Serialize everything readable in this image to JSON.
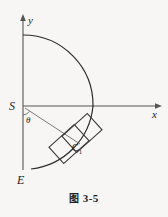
{
  "figure": {
    "caption_prefix": "图",
    "caption_number": "3-5",
    "caption_full": "图 3-5",
    "background_color": "#f7f6f4",
    "ink_color": "#2b2b2b",
    "width": 168,
    "height": 217
  },
  "axes": {
    "x_label": "x",
    "y_label": "y",
    "origin_label": "S",
    "x_axis_y": 106,
    "y_axis_x": 23,
    "x_axis_start": 23,
    "x_axis_end": 160,
    "y_axis_top": 16,
    "y_axis_bottom": 106
  },
  "labels": {
    "origin": "S",
    "lower_end": "E",
    "angle": "θ",
    "body_center": "C",
    "body_center_subscript": "1",
    "body_center_full": "C₁"
  },
  "arc": {
    "description": "semicircular arc from upper point on y-axis through x-axis crossing down to lower point near E",
    "top_point": [
      23,
      35
    ],
    "right_crossing": [
      93,
      106
    ],
    "bottom_point": [
      30,
      168
    ],
    "radius_px": 70
  },
  "vertical_segment": {
    "from": [
      23,
      106
    ],
    "to": [
      23,
      168
    ],
    "end_label": "E"
  },
  "ray": {
    "from": [
      26,
      109
    ],
    "to": [
      78,
      143
    ],
    "angle_label": "θ",
    "angle_label_pos": [
      27,
      120
    ]
  },
  "bodies": [
    {
      "name": "rectangle-upper",
      "center": [
        80,
        134
      ],
      "width": 34,
      "height": 22,
      "rotation_deg": -42
    },
    {
      "name": "rectangle-lower",
      "center": [
        68,
        143
      ],
      "width": 34,
      "height": 22,
      "rotation_deg": -42
    }
  ]
}
